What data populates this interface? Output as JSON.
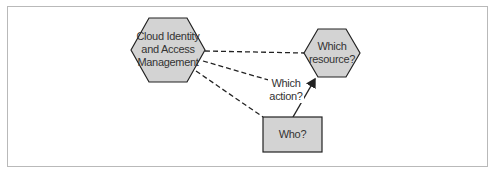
{
  "diagram": {
    "nodes": [
      {
        "id": "ciam",
        "shape": "hexagon",
        "label_lines": [
          "Cloud Identity",
          "and Access",
          "Management"
        ]
      },
      {
        "id": "resource",
        "shape": "hexagon",
        "label_lines": [
          "Which",
          "resource?"
        ]
      },
      {
        "id": "who",
        "shape": "rectangle",
        "label": "Who?"
      }
    ],
    "edge_labels": {
      "action_lines": [
        "Which",
        "action?"
      ]
    },
    "edges": [
      {
        "from": "ciam",
        "to": "resource",
        "style": "dashed"
      },
      {
        "from": "ciam",
        "to": "action-label",
        "style": "dashed"
      },
      {
        "from": "ciam",
        "to": "who",
        "style": "dashed"
      },
      {
        "from": "who",
        "to": "resource",
        "style": "solid-arrow"
      }
    ],
    "colors": {
      "node_fill": "#d3d3d3",
      "stroke": "#222222",
      "frame": "#b9b9b9"
    }
  }
}
